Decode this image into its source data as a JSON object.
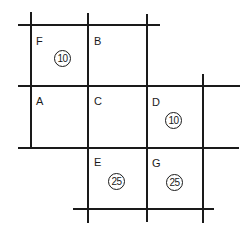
{
  "diagram": {
    "type": "grid-of-cells",
    "line_color": "#1a1a1a",
    "background": "#ffffff",
    "cells": [
      {
        "id": "F",
        "label": "F",
        "value": "10",
        "row": 0,
        "col": 0
      },
      {
        "id": "B",
        "label": "B",
        "value": null,
        "row": 0,
        "col": 1
      },
      {
        "id": "A",
        "label": "A",
        "value": null,
        "row": 1,
        "col": 0
      },
      {
        "id": "C",
        "label": "C",
        "value": null,
        "row": 1,
        "col": 1
      },
      {
        "id": "D",
        "label": "D",
        "value": "10",
        "row": 1,
        "col": 2
      },
      {
        "id": "E",
        "label": "E",
        "value": "25",
        "row": 2,
        "col": 1
      },
      {
        "id": "G",
        "label": "G",
        "value": "25",
        "row": 2,
        "col": 2
      }
    ]
  },
  "labels": {
    "F": "F",
    "B": "B",
    "A": "A",
    "C": "C",
    "D": "D",
    "E": "E",
    "G": "G"
  },
  "values": {
    "F": "10",
    "D": "10",
    "E": "25",
    "G": "25"
  }
}
